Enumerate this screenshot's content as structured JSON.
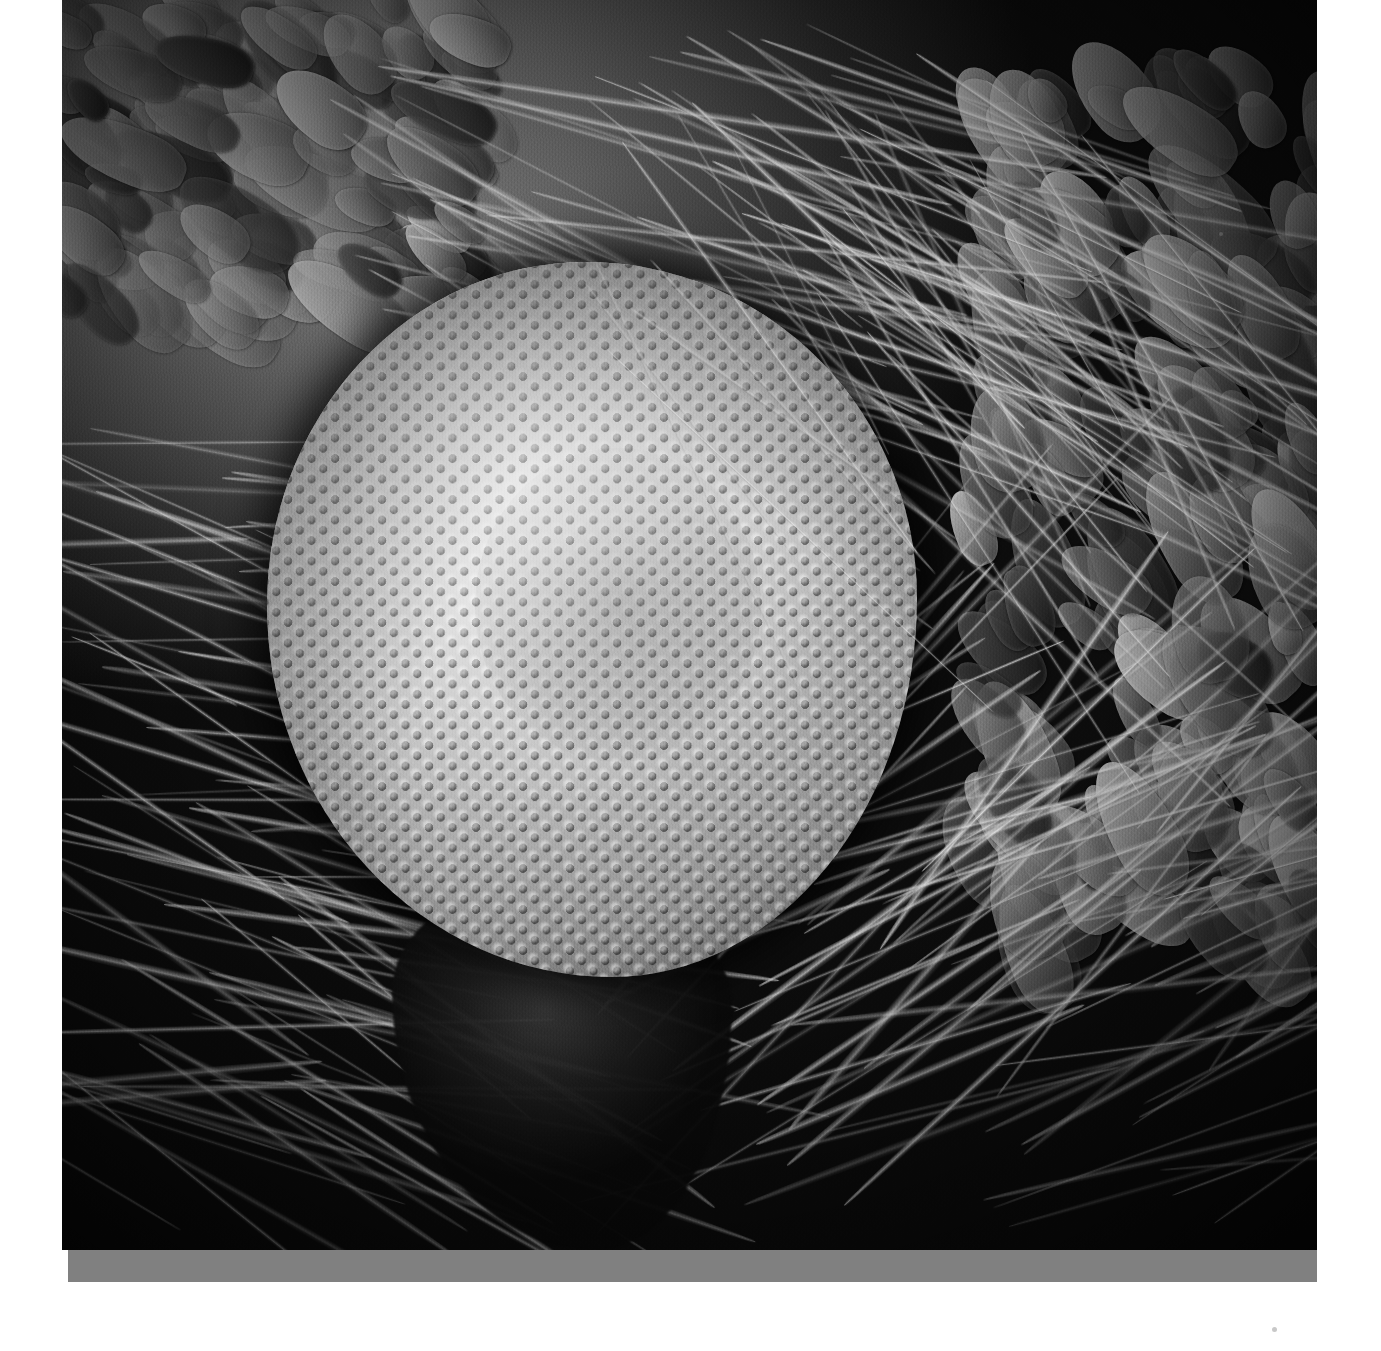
{
  "document": {
    "kind": "scanning-electron-micrograph",
    "title": "Insect compound eye",
    "color_mode": "Grayscale",
    "background_color": "#ffffff",
    "plate_background_color": "#0a0a0a",
    "baseline_bar_color": "#808080"
  },
  "plate": {
    "left": 62,
    "top": 0,
    "width": 1255,
    "height": 1250
  },
  "subject": {
    "name": "compound-eye",
    "description": "Hemispherical compound eye composed of close-packed hexagonal ommatidia",
    "center_x": 530,
    "center_y": 620,
    "width": 650,
    "height": 715,
    "facet_pitch_px": 23,
    "facet_shape": "hexagonal",
    "tone_light": "#efefef",
    "tone_mid": "#b4b4b4",
    "tone_dark": "#2c2c2c"
  },
  "features": [
    {
      "name": "scale-cluster-top-left",
      "label": "Overlapping cuticular scales"
    },
    {
      "name": "scale-cluster-right",
      "label": "Overlapping cuticular scales"
    },
    {
      "name": "bristle-field-left",
      "label": "Flowing setae / bristles"
    },
    {
      "name": "bristle-field-upper",
      "label": "Arcing setae over the eye"
    },
    {
      "name": "palp-region-bottom",
      "label": "Dark palp and head cuticle"
    }
  ],
  "baseline_bar": {
    "left": 68,
    "top": 1250,
    "width": 1249,
    "height": 32,
    "color": "#808080"
  }
}
